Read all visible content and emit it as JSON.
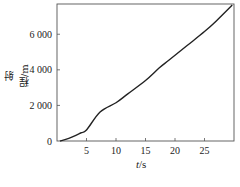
{
  "chart_data": {
    "type": "line",
    "title": "",
    "xlabel": "t/s",
    "xlabel_italic_part": "t",
    "xlabel_unit": "/s",
    "ylabel": "射程/m",
    "xlim": [
      0,
      30
    ],
    "ylim": [
      0,
      7700
    ],
    "xticks": [
      5,
      10,
      15,
      20,
      25
    ],
    "xtick_labels": [
      "5",
      "10",
      "15",
      "20",
      "25"
    ],
    "yticks": [
      0,
      2000,
      4000,
      6000
    ],
    "ytick_labels": [
      "0",
      "2 000",
      "4 000",
      "6 000"
    ],
    "grid": false,
    "legend": null,
    "series": [
      {
        "name": "射程",
        "color": "#222222",
        "x": [
          0.5,
          2,
          4,
          5,
          7.3,
          10,
          12,
          15,
          17.3,
          19,
          22,
          25,
          27,
          29.7
        ],
        "y": [
          0,
          150,
          450,
          620,
          1630,
          2150,
          2650,
          3400,
          4100,
          4550,
          5350,
          6150,
          6750,
          7640
        ]
      }
    ]
  }
}
